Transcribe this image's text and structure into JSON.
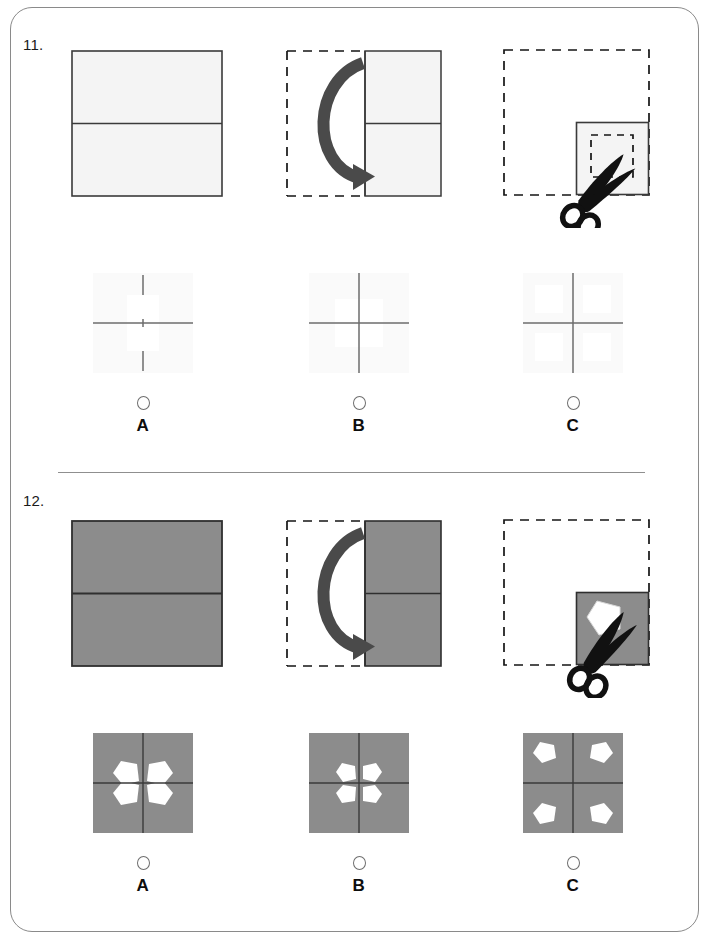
{
  "page": {
    "border_color": "#8a8a8a",
    "background": "#ffffff"
  },
  "colors": {
    "paper_light": "#f4f4f4",
    "paper_gray": "#8c8c8c",
    "outline": "#3a3a3a",
    "fold_arrow": "#4a4a4a",
    "scissors": "#111111",
    "cut_white": "#ffffff",
    "divider": "#8f8f8f",
    "radio_stroke": "#6e6e6e",
    "faint_fold_line": "#9a9a9a"
  },
  "questions": [
    {
      "number": "11.",
      "paper_fill": "#f4f4f4",
      "cut_shape": "square",
      "stimulus": [
        {
          "step": "1",
          "name": "unfolded-sheet",
          "description": "Unfolded square sheet with one horizontal fold line across the middle",
          "border_style": "solid",
          "fold_lines": [
            "horizontal-center"
          ]
        },
        {
          "step": "2",
          "name": "half-folded-sheet",
          "description": "Sheet folded in half right-to-left; curved arrow shows the left half folding over",
          "border_style": "dashed-left-half",
          "arrow": "fold-arrow-left",
          "fold_lines": [
            "horizontal-center"
          ]
        },
        {
          "step": "3",
          "name": "quarter-folded-sheet-with-cut",
          "description": "Sheet folded into a quarter; dashed square marks the cut and scissors cut it out",
          "border_style": "dashed-outline",
          "cut_marker": "dashed-square",
          "tool": "scissors-icon"
        }
      ],
      "options": [
        {
          "letter": "A",
          "name": "option-a",
          "description": "Light square; vertical fold line broken at center, horizontal fold line continuous; narrow rectangular cut at center",
          "cut_layout": "center-vertical-slot",
          "selected": false
        },
        {
          "letter": "B",
          "name": "option-b",
          "description": "Light square; full cross of fold lines with a square cut-out centred on the crossing point",
          "cut_layout": "center-square",
          "selected": false
        },
        {
          "letter": "C",
          "name": "option-c",
          "description": "Light square; full cross of fold lines with four faint square cut-outs, one in each quadrant",
          "cut_layout": "four-quadrant-squares",
          "selected": false
        }
      ]
    },
    {
      "number": "12.",
      "paper_fill": "#8c8c8c",
      "cut_shape": "pentagon",
      "stimulus": [
        {
          "step": "1",
          "name": "unfolded-sheet",
          "description": "Unfolded gray square sheet with one horizontal fold line across the middle",
          "border_style": "solid",
          "fold_lines": [
            "horizontal-center"
          ]
        },
        {
          "step": "2",
          "name": "half-folded-sheet",
          "description": "Gray sheet folded in half right-to-left; curved arrow shows the left half folding over",
          "border_style": "dashed-left-half",
          "arrow": "fold-arrow-left",
          "fold_lines": [
            "horizontal-center"
          ]
        },
        {
          "step": "3",
          "name": "quarter-folded-sheet-with-cut",
          "description": "Gray sheet folded into a quarter; a white pentagon has been cut out and scissors rest on the edge",
          "border_style": "dashed-outline",
          "cut_marker": "pentagon-hole",
          "tool": "scissors-icon"
        }
      ],
      "options": [
        {
          "letter": "A",
          "name": "option-a",
          "description": "Gray square with cross fold lines and four large white pentagons clustered around the centre, touching the fold lines",
          "cut_layout": "four-pentagons-centre-large",
          "selected": false
        },
        {
          "letter": "B",
          "name": "option-b",
          "description": "Gray square with cross fold lines and four smaller white pentagons tightly grouped at the centre",
          "cut_layout": "four-pentagons-centre-small",
          "selected": false
        },
        {
          "letter": "C",
          "name": "option-c",
          "description": "Gray square with cross fold lines and four white pentagons placed in the outer corners",
          "cut_layout": "four-pentagons-corners",
          "selected": false
        }
      ]
    }
  ],
  "icons": {
    "scissors": "scissors-icon",
    "fold_arrow": "curved-fold-arrow-icon",
    "radio": "radio-button-icon"
  }
}
